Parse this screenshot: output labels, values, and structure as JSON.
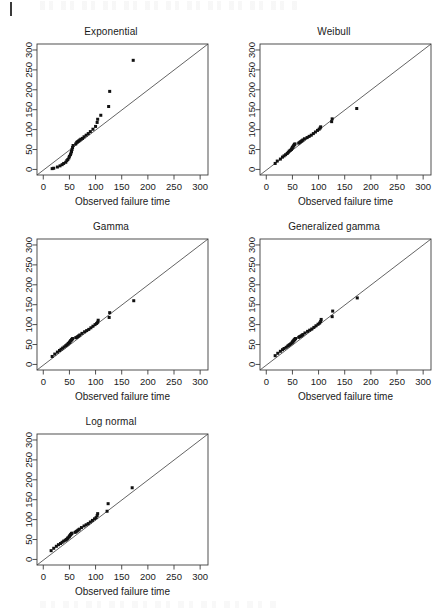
{
  "figure": {
    "kind": "qq-plot-panel-grid",
    "panel_count": 5,
    "shared_xlabel": "Observed failure time",
    "shared_x_ticks": [
      "0",
      "50",
      "100",
      "150",
      "200",
      "250",
      "300"
    ],
    "shared_y_ticks": [
      "0",
      "50",
      "100",
      "150",
      "200",
      "250",
      "300"
    ],
    "reference_line": "y = x diagonal",
    "point_color": "#111111",
    "axis_color": "#3c3c3c"
  },
  "chart_data": [
    {
      "type": "scatter",
      "title": "Exponential",
      "xlabel": "Observed failure time",
      "ylabel": "",
      "xlim": [
        -12,
        315
      ],
      "ylim": [
        -14,
        315
      ],
      "xticks": [
        0,
        50,
        100,
        150,
        200,
        250,
        300
      ],
      "yticks": [
        0,
        50,
        100,
        150,
        200,
        250,
        300
      ],
      "grid": false,
      "legend": "none",
      "reference_line": {
        "type": "identity",
        "from": [
          -12,
          -14
        ],
        "to": [
          315,
          315
        ]
      },
      "points": [
        [
          17,
          2
        ],
        [
          20,
          3
        ],
        [
          27,
          6
        ],
        [
          32,
          9
        ],
        [
          36,
          12
        ],
        [
          39,
          15
        ],
        [
          43,
          18
        ],
        [
          45,
          22
        ],
        [
          47,
          25
        ],
        [
          49,
          29
        ],
        [
          50,
          33
        ],
        [
          52,
          37
        ],
        [
          53,
          41
        ],
        [
          54,
          45
        ],
        [
          55,
          50
        ],
        [
          56,
          55
        ],
        [
          57,
          60
        ],
        [
          62,
          64
        ],
        [
          64,
          68
        ],
        [
          66,
          70
        ],
        [
          68,
          72
        ],
        [
          70,
          74
        ],
        [
          72,
          76
        ],
        [
          75,
          78
        ],
        [
          78,
          82
        ],
        [
          82,
          86
        ],
        [
          86,
          90
        ],
        [
          90,
          95
        ],
        [
          95,
          101
        ],
        [
          100,
          108
        ],
        [
          103,
          118
        ],
        [
          104,
          126
        ],
        [
          110,
          136
        ],
        [
          125,
          158
        ],
        [
          127,
          196
        ],
        [
          172,
          274
        ]
      ]
    },
    {
      "type": "scatter",
      "title": "Weibull",
      "xlabel": "Observed failure time",
      "ylabel": "",
      "xlim": [
        -12,
        315
      ],
      "ylim": [
        -14,
        315
      ],
      "xticks": [
        0,
        50,
        100,
        150,
        200,
        250,
        300
      ],
      "yticks": [
        0,
        50,
        100,
        150,
        200,
        250,
        300
      ],
      "grid": false,
      "legend": "none",
      "reference_line": {
        "type": "identity",
        "from": [
          -12,
          -14
        ],
        "to": [
          315,
          315
        ]
      },
      "points": [
        [
          17,
          15
        ],
        [
          21,
          21
        ],
        [
          27,
          26
        ],
        [
          31,
          31
        ],
        [
          34,
          34
        ],
        [
          37,
          37
        ],
        [
          40,
          40
        ],
        [
          42,
          43
        ],
        [
          44,
          46
        ],
        [
          46,
          48
        ],
        [
          48,
          50
        ],
        [
          49,
          53
        ],
        [
          50,
          55
        ],
        [
          51,
          57
        ],
        [
          52,
          59
        ],
        [
          53,
          61
        ],
        [
          54,
          63
        ],
        [
          55,
          64
        ],
        [
          62,
          66
        ],
        [
          64,
          68
        ],
        [
          66,
          70
        ],
        [
          68,
          72
        ],
        [
          70,
          74
        ],
        [
          73,
          77
        ],
        [
          78,
          80
        ],
        [
          82,
          83
        ],
        [
          86,
          86
        ],
        [
          90,
          90
        ],
        [
          94,
          94
        ],
        [
          98,
          98
        ],
        [
          101,
          101
        ],
        [
          103,
          104
        ],
        [
          104,
          107
        ],
        [
          125,
          120
        ],
        [
          126,
          127
        ],
        [
          173,
          153
        ]
      ]
    },
    {
      "type": "scatter",
      "title": "Gamma",
      "xlabel": "Observed failure time",
      "ylabel": "",
      "xlim": [
        -12,
        315
      ],
      "ylim": [
        -14,
        315
      ],
      "xticks": [
        0,
        50,
        100,
        150,
        200,
        250,
        300
      ],
      "yticks": [
        0,
        50,
        100,
        150,
        200,
        250,
        300
      ],
      "grid": false,
      "legend": "none",
      "reference_line": {
        "type": "identity",
        "from": [
          -12,
          -14
        ],
        "to": [
          315,
          315
        ]
      },
      "points": [
        [
          17,
          20
        ],
        [
          22,
          26
        ],
        [
          27,
          31
        ],
        [
          31,
          35
        ],
        [
          34,
          38
        ],
        [
          37,
          41
        ],
        [
          40,
          44
        ],
        [
          43,
          47
        ],
        [
          45,
          49
        ],
        [
          47,
          51
        ],
        [
          48,
          53
        ],
        [
          50,
          55
        ],
        [
          51,
          57
        ],
        [
          52,
          59
        ],
        [
          53,
          60
        ],
        [
          54,
          62
        ],
        [
          55,
          63
        ],
        [
          56,
          65
        ],
        [
          62,
          67
        ],
        [
          64,
          68
        ],
        [
          66,
          70
        ],
        [
          68,
          72
        ],
        [
          70,
          74
        ],
        [
          74,
          78
        ],
        [
          79,
          82
        ],
        [
          83,
          85
        ],
        [
          87,
          88
        ],
        [
          91,
          92
        ],
        [
          95,
          96
        ],
        [
          99,
          100
        ],
        [
          102,
          103
        ],
        [
          104,
          106
        ],
        [
          105,
          111
        ],
        [
          126,
          118
        ],
        [
          127,
          130
        ],
        [
          173,
          160
        ]
      ]
    },
    {
      "type": "scatter",
      "title": "Generalized gamma",
      "xlabel": "Observed failure time",
      "ylabel": "",
      "xlim": [
        -12,
        315
      ],
      "ylim": [
        -14,
        315
      ],
      "xticks": [
        0,
        50,
        100,
        150,
        200,
        250,
        300
      ],
      "yticks": [
        0,
        50,
        100,
        150,
        200,
        250,
        300
      ],
      "grid": false,
      "legend": "none",
      "reference_line": {
        "type": "identity",
        "from": [
          -12,
          -14
        ],
        "to": [
          315,
          315
        ]
      },
      "points": [
        [
          17,
          22
        ],
        [
          22,
          28
        ],
        [
          27,
          33
        ],
        [
          31,
          37
        ],
        [
          34,
          40
        ],
        [
          38,
          43
        ],
        [
          41,
          46
        ],
        [
          43,
          48
        ],
        [
          45,
          50
        ],
        [
          47,
          52
        ],
        [
          49,
          54
        ],
        [
          50,
          56
        ],
        [
          51,
          58
        ],
        [
          52,
          59
        ],
        [
          53,
          61
        ],
        [
          54,
          62
        ],
        [
          55,
          64
        ],
        [
          56,
          65
        ],
        [
          62,
          68
        ],
        [
          64,
          70
        ],
        [
          66,
          71
        ],
        [
          68,
          73
        ],
        [
          70,
          75
        ],
        [
          74,
          79
        ],
        [
          79,
          83
        ],
        [
          83,
          86
        ],
        [
          87,
          89
        ],
        [
          91,
          93
        ],
        [
          95,
          97
        ],
        [
          99,
          101
        ],
        [
          102,
          104
        ],
        [
          104,
          108
        ],
        [
          105,
          113
        ],
        [
          126,
          120
        ],
        [
          127,
          134
        ],
        [
          174,
          167
        ]
      ]
    },
    {
      "type": "scatter",
      "title": "Log normal",
      "xlabel": "Observed failure time",
      "ylabel": "",
      "xlim": [
        -12,
        315
      ],
      "ylim": [
        -14,
        315
      ],
      "xticks": [
        0,
        50,
        100,
        150,
        200,
        250,
        300
      ],
      "yticks": [
        0,
        50,
        100,
        150,
        200,
        250,
        300
      ],
      "grid": false,
      "legend": "none",
      "reference_line": {
        "type": "identity",
        "from": [
          -12,
          -14
        ],
        "to": [
          315,
          315
        ]
      },
      "points": [
        [
          15,
          22
        ],
        [
          20,
          28
        ],
        [
          25,
          33
        ],
        [
          29,
          37
        ],
        [
          33,
          40
        ],
        [
          36,
          43
        ],
        [
          39,
          46
        ],
        [
          42,
          48
        ],
        [
          44,
          50
        ],
        [
          46,
          52
        ],
        [
          47,
          54
        ],
        [
          49,
          56
        ],
        [
          50,
          58
        ],
        [
          51,
          60
        ],
        [
          52,
          62
        ],
        [
          53,
          63
        ],
        [
          54,
          65
        ],
        [
          55,
          66
        ],
        [
          61,
          68
        ],
        [
          63,
          70
        ],
        [
          65,
          72
        ],
        [
          67,
          74
        ],
        [
          69,
          76
        ],
        [
          73,
          80
        ],
        [
          78,
          84
        ],
        [
          82,
          87
        ],
        [
          86,
          90
        ],
        [
          90,
          94
        ],
        [
          94,
          98
        ],
        [
          98,
          102
        ],
        [
          101,
          105
        ],
        [
          103,
          110
        ],
        [
          104,
          115
        ],
        [
          122,
          121
        ],
        [
          124,
          140
        ],
        [
          170,
          180
        ]
      ]
    }
  ]
}
